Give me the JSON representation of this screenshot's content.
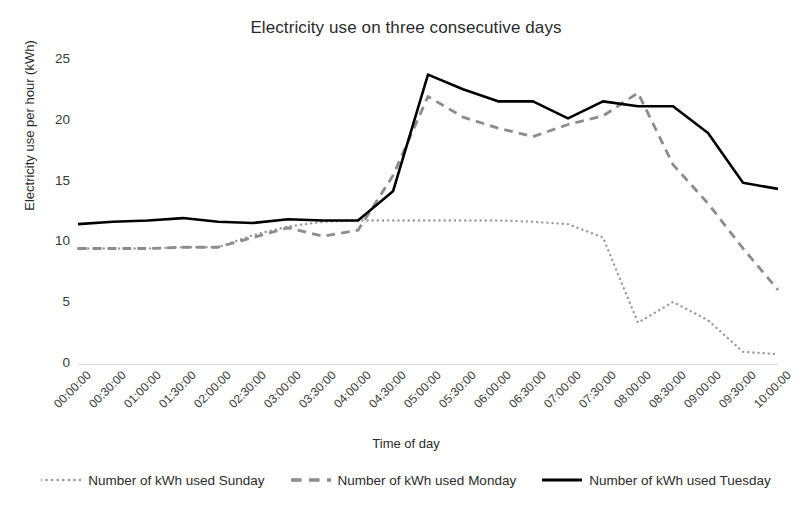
{
  "chart_data": {
    "type": "line",
    "title": "Electricity use on three consecutive days",
    "xlabel": "Time of day",
    "ylabel": "Electricity use per hour (kWh)",
    "ylim": [
      0,
      25
    ],
    "yticks": [
      0,
      5,
      10,
      15,
      20,
      25
    ],
    "grid": false,
    "legend_position": "bottom",
    "categories": [
      "00:00:00",
      "00:30:00",
      "01:00:00",
      "01:30:00",
      "02:00:00",
      "02:30:00",
      "03:00:00",
      "03:30:00",
      "04:00:00",
      "04:30:00",
      "05:00:00",
      "05:30:00",
      "06:00:00",
      "06:30:00",
      "07:00:00",
      "07:30:00",
      "08:00:00",
      "08:30:00",
      "09:00:00",
      "09:30:00",
      "10:00:00"
    ],
    "series": [
      {
        "name": "Number of kWh used Sunday",
        "style": "dotted",
        "color": "#9a9a9a",
        "values": [
          9.5,
          9.5,
          9.5,
          9.6,
          9.6,
          10.6,
          11.3,
          11.7,
          11.8,
          11.8,
          11.8,
          11.8,
          11.8,
          11.7,
          11.5,
          10.4,
          3.4,
          5.1,
          3.6,
          1.0,
          0.8
        ]
      },
      {
        "name": "Number of kWh used Monday",
        "style": "dashed",
        "color": "#8c8c8c",
        "values": [
          9.5,
          9.5,
          9.5,
          9.6,
          9.6,
          10.4,
          11.2,
          10.5,
          11.0,
          15.5,
          22.0,
          20.3,
          19.4,
          18.7,
          19.7,
          20.4,
          22.3,
          16.4,
          13.2,
          9.5,
          6.1
        ]
      },
      {
        "name": "Number of kWh used Tuesday",
        "style": "solid",
        "color": "#000000",
        "values": [
          11.5,
          11.7,
          11.8,
          12.0,
          11.7,
          11.6,
          11.9,
          11.8,
          11.8,
          14.2,
          23.8,
          22.6,
          21.6,
          21.6,
          20.2,
          21.6,
          21.2,
          21.2,
          19.0,
          14.9,
          14.4
        ]
      }
    ]
  }
}
